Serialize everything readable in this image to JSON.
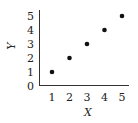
{
  "chart_data": {
    "type": "scatter",
    "title": "",
    "xlabel": "X",
    "ylabel": "Y",
    "x": [
      1,
      2,
      3,
      4,
      5
    ],
    "y": [
      1,
      2,
      3,
      4,
      5
    ],
    "xlim": [
      0,
      5.3
    ],
    "ylim": [
      0,
      5.4
    ],
    "xticks": [
      "1",
      "2",
      "3",
      "4",
      "5"
    ],
    "yticks": [
      "0",
      "1",
      "2",
      "3",
      "4",
      "5"
    ],
    "grid": false,
    "legend": null,
    "colors": {
      "point": "#111111",
      "axis": "#333333",
      "text": "#222222"
    }
  }
}
